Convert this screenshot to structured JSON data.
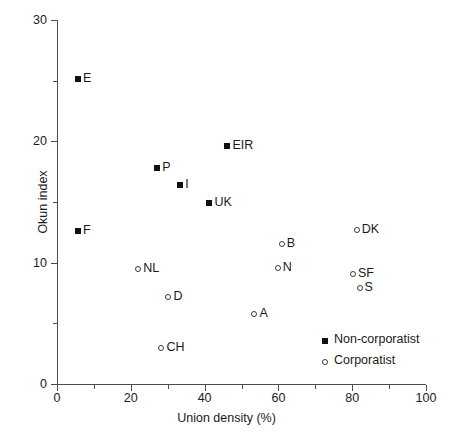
{
  "chart_data": {
    "type": "scatter",
    "title": "",
    "xlabel": "Union density (%)",
    "ylabel": "Okun index",
    "xlim": [
      0,
      100
    ],
    "ylim": [
      0,
      30
    ],
    "xticks": [
      0,
      20,
      40,
      60,
      80,
      100
    ],
    "xticks_minor": [
      10,
      30,
      50,
      70,
      90
    ],
    "yticks": [
      0,
      10,
      20,
      30
    ],
    "yticks_minor": [
      5,
      15,
      25
    ],
    "xtick_labels": [
      "0",
      "20",
      "40",
      "60",
      "80",
      "100"
    ],
    "ytick_labels": [
      "0",
      "10",
      "20",
      "30"
    ],
    "grid": false,
    "legend_position": "lower-right",
    "series": [
      {
        "name": "Non-corporatist",
        "marker": "filled-square",
        "color": "#111111",
        "points": [
          {
            "label": "E",
            "x": 5.7,
            "y": 25.1
          },
          {
            "label": "F",
            "x": 5.7,
            "y": 12.6
          },
          {
            "label": "P",
            "x": 27.2,
            "y": 17.8
          },
          {
            "label": "I",
            "x": 33.4,
            "y": 16.4
          },
          {
            "label": "UK",
            "x": 41.3,
            "y": 14.9
          },
          {
            "label": "EIR",
            "x": 46.2,
            "y": 19.6
          }
        ]
      },
      {
        "name": "Corporatist",
        "marker": "open-circle",
        "color": "#3a3a3a",
        "points": [
          {
            "label": "NL",
            "x": 22.0,
            "y": 9.5
          },
          {
            "label": "D",
            "x": 30.2,
            "y": 7.2
          },
          {
            "label": "CH",
            "x": 28.3,
            "y": 3.0
          },
          {
            "label": "A",
            "x": 53.5,
            "y": 5.8
          },
          {
            "label": "N",
            "x": 59.8,
            "y": 9.6
          },
          {
            "label": "B",
            "x": 60.9,
            "y": 11.5
          },
          {
            "label": "SF",
            "x": 80.2,
            "y": 9.1
          },
          {
            "label": "DK",
            "x": 81.2,
            "y": 12.7
          },
          {
            "label": "S",
            "x": 82.0,
            "y": 7.9
          }
        ]
      }
    ],
    "legend": [
      {
        "label": "Non-corporatist",
        "marker": "filled-square"
      },
      {
        "label": "Corporatist",
        "marker": "open-circle"
      }
    ]
  }
}
